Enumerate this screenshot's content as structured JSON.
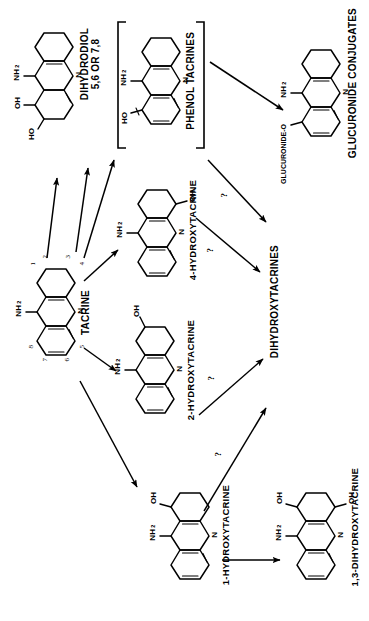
{
  "diagram": {
    "type": "metabolic-pathway-scheme",
    "orientation": "labels rotated 90 degrees counter-clockwise"
  },
  "nodes": {
    "tacrine": {
      "label": "TACRINE",
      "substituents": [
        "NH2",
        "N"
      ],
      "ring_numbers": [
        "1",
        "2",
        "3",
        "4",
        "5",
        "6",
        "7",
        "8"
      ]
    },
    "dihydrodiol": {
      "label_line1": "DIHYDRODIOL",
      "label_line2": "5,6 OR 7,8",
      "substituents": [
        "NH2",
        "N",
        "OH",
        "HO"
      ]
    },
    "phenol_tacrines": {
      "label": "PHENOL TACRINES",
      "substituents": [
        "NH2",
        "N",
        "HO"
      ],
      "bracketed": "true"
    },
    "glucuronide_conjugates": {
      "label": "GLUCURONIDE CONJUGATES",
      "substituents": [
        "NH2",
        "N",
        "GLUCURONIDE-O"
      ]
    },
    "hydroxy4": {
      "label": "4-HYDROXYTACRINE",
      "substituents": [
        "NH2",
        "N",
        "OH"
      ]
    },
    "hydroxy2": {
      "label": "2-HYDROXYTACRINE",
      "substituents": [
        "NH2",
        "N",
        "OH"
      ]
    },
    "hydroxy1": {
      "label": "1-HYDROXYTACRINE",
      "substituents": [
        "NH2",
        "N",
        "OH"
      ]
    },
    "dihydroxytacrines": {
      "label": "DIHYDROXYTACRINES"
    },
    "dihydroxy13": {
      "label": "1,3-DIHYDROXYTACRINE",
      "substituents": [
        "NH2",
        "N",
        "OH",
        "OH"
      ]
    }
  },
  "arrows": [
    {
      "from": "tacrine",
      "to": "dihydrodiol",
      "annotation": ""
    },
    {
      "from": "tacrine",
      "to": "dihydrodiol",
      "annotation": ""
    },
    {
      "from": "tacrine",
      "to": "phenol_tacrines",
      "annotation": ""
    },
    {
      "from": "tacrine",
      "to": "hydroxy4",
      "annotation": ""
    },
    {
      "from": "tacrine",
      "to": "hydroxy2",
      "annotation": ""
    },
    {
      "from": "tacrine",
      "to": "hydroxy1",
      "annotation": ""
    },
    {
      "from": "phenol_tacrines",
      "to": "glucuronide_conjugates",
      "annotation": ""
    },
    {
      "from": "phenol_tacrines",
      "to": "dihydroxytacrines",
      "annotation": "?"
    },
    {
      "from": "hydroxy4",
      "to": "dihydroxytacrines",
      "annotation": "?"
    },
    {
      "from": "hydroxy2",
      "to": "dihydroxytacrines",
      "annotation": "?"
    },
    {
      "from": "hydroxy1",
      "to": "dihydroxytacrines",
      "annotation": "?"
    },
    {
      "from": "hydroxy1",
      "to": "dihydroxy13",
      "annotation": ""
    }
  ],
  "annotations": {
    "question": "?"
  },
  "colors": {
    "ink": "#000000",
    "background": "#ffffff"
  }
}
